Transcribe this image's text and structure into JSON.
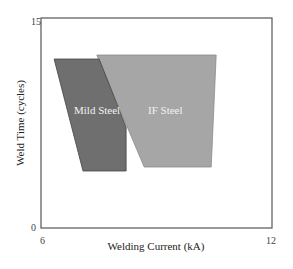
{
  "chart_data": {
    "type": "area",
    "title": "",
    "xlabel": "Welding Current (kA)",
    "ylabel": "Weld Time (cycles)",
    "xlim": [
      6,
      12
    ],
    "ylim": [
      0,
      15
    ],
    "x_ticks": [
      "6",
      "12"
    ],
    "y_ticks": [
      "0",
      "15"
    ],
    "grid": false,
    "legend": "none (labels inside regions)",
    "series": [
      {
        "name": "IF Steel",
        "color": "#a6a6a6",
        "polygon": [
          [
            7.45,
            12.36
          ],
          [
            10.55,
            12.36
          ],
          [
            10.42,
            4.36
          ],
          [
            8.68,
            4.36
          ]
        ]
      },
      {
        "name": "Mild Steel",
        "color": "#6f6f6f",
        "polygon": [
          [
            6.34,
            12.07
          ],
          [
            7.51,
            12.07
          ],
          [
            8.21,
            7.21
          ],
          [
            8.21,
            4.07
          ],
          [
            7.09,
            4.07
          ]
        ]
      }
    ]
  },
  "labels": {
    "x_axis": "Welding Current (kA)",
    "y_axis": "Weld Time (cycles)",
    "x_min": "6",
    "x_max": "12",
    "y_min": "0",
    "y_max": "15",
    "region_mild": "Mild Steel",
    "region_if": "IF Steel"
  }
}
